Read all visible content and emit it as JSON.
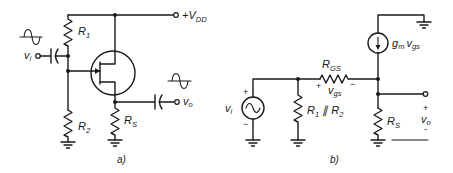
{
  "figure": {
    "panels": [
      {
        "id": "a",
        "caption": "a)",
        "title": "JFET source-follower circuit",
        "labels": {
          "supply_main": "+V",
          "supply_sub": "DD",
          "r1_main": "R",
          "r1_sub": "1",
          "r2_main": "R",
          "r2_sub": "2",
          "rs_main": "R",
          "rs_sub": "S",
          "vi_main": "v",
          "vi_sub": "i",
          "vo_main": "v",
          "vo_sub": "o"
        },
        "components": [
          "R1",
          "R2",
          "RS",
          "JFET",
          "input capacitor",
          "output capacitor",
          "input sine source",
          "output sine waveform",
          "ground",
          "ground"
        ]
      },
      {
        "id": "b",
        "caption": "b)",
        "title": "Small-signal equivalent circuit",
        "labels": {
          "rgs_main": "R",
          "rgs_sub": "GS",
          "vgs_main": "v",
          "vgs_sub": "gs",
          "gm_main": "g",
          "gm_sub": "m",
          "gm_v_main": "v",
          "gm_v_sub": "gs",
          "rpar_main1": "R",
          "rpar_sub1": "1",
          "rpar_sep": " ∥ ",
          "rpar_main2": "R",
          "rpar_sub2": "2",
          "rs_main": "R",
          "rs_sub": "S",
          "vi_main": "v",
          "vi_sub": "i",
          "vo_main": "v",
          "vo_sub": "o",
          "plus": "+",
          "minus": "−",
          "vo_minus": "-"
        },
        "components": [
          "vi AC source",
          "R1 || R2",
          "RGS",
          "dependent current source gm*vgs",
          "RS",
          "ground",
          "ground",
          "ground",
          "ground"
        ]
      }
    ]
  }
}
